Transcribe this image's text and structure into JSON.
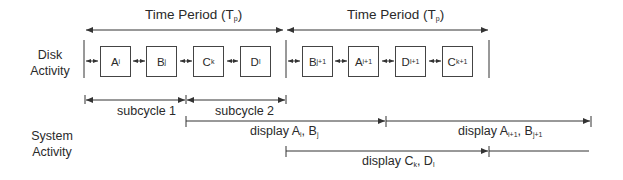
{
  "diagram": {
    "period_labels": [
      {
        "text": "Time Period (T",
        "sub": "p",
        "close": ")"
      },
      {
        "text": "Time Period (T",
        "sub": "p",
        "close": ")"
      }
    ],
    "rows": {
      "disk": {
        "line1": "Disk",
        "line2": "Activity"
      },
      "system": {
        "line1": "System",
        "line2": "Activity"
      }
    },
    "period1_boxes": [
      {
        "letter": "A",
        "sub": "i"
      },
      {
        "letter": "B",
        "sub": "j"
      },
      {
        "letter": "C",
        "sub": "k"
      },
      {
        "letter": "D",
        "sub": "l"
      }
    ],
    "period2_boxes": [
      {
        "letter": "B",
        "sub": "j+1"
      },
      {
        "letter": "A",
        "sub": "i+1"
      },
      {
        "letter": "D",
        "sub": "l+1"
      },
      {
        "letter": "C",
        "sub": "k+1"
      }
    ],
    "subcycles": [
      "subcycle 1",
      "subcycle 2"
    ],
    "displays": [
      {
        "prefix": "display A",
        "s1": "i",
        "mid": ", B",
        "s2": "j"
      },
      {
        "prefix": "display A",
        "s1": "i+1",
        "mid": ", B",
        "s2": "j+1"
      },
      {
        "prefix": "display C",
        "s1": "k",
        "mid": ", D",
        "s2": "l"
      }
    ],
    "colors": {
      "line": "#333333",
      "text": "#2a2a2a"
    }
  }
}
